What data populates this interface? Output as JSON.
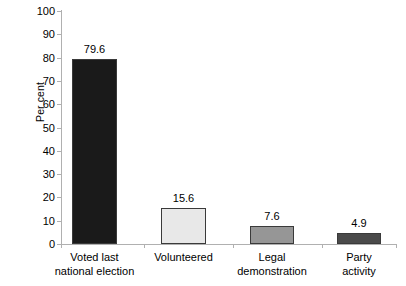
{
  "chart_data": {
    "type": "bar",
    "title": "",
    "subtitle": "",
    "xlabel": "",
    "ylabel": "Per cent",
    "ylim": [
      0,
      100
    ],
    "ytick_step": 10,
    "grid": false,
    "legend": "none",
    "categories": [
      "Voted last\nnational election",
      "Volunteered",
      "Legal\ndemonstration",
      "Party activity"
    ],
    "values": [
      79.6,
      15.6,
      7.6,
      4.9
    ],
    "value_labels": [
      "79.6",
      "15.6",
      "7.6",
      "4.9"
    ],
    "bar_colors": [
      "#1a1a1a",
      "#e8e8e8",
      "#969696",
      "#4a4a4a"
    ],
    "bar_border_color": "#3a3a3a",
    "yticks": [
      "0",
      "10",
      "20",
      "30",
      "40",
      "50",
      "60",
      "70",
      "80",
      "90",
      "100"
    ],
    "ytick_values": [
      0,
      10,
      20,
      30,
      40,
      50,
      60,
      70,
      80,
      90,
      100
    ],
    "axis_color": "#b0b0b0",
    "text_color": "#000000",
    "background": "#ffffff"
  }
}
